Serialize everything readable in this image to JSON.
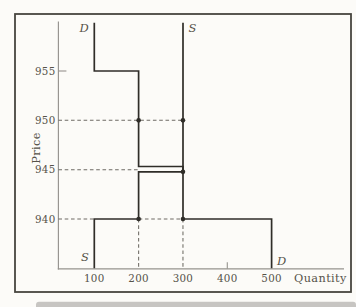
{
  "figure": {
    "colors": {
      "paper": "#fcfbf8",
      "frame": "#47453f",
      "axis": "#96938e",
      "curve": "#2f2d28",
      "dash": "#6e6b64",
      "text": "#565249",
      "band": "#c7c5c2"
    }
  },
  "chart_data": {
    "type": "line",
    "subtype": "step-supply-demand",
    "title": "",
    "xlabel": "Quantity",
    "ylabel": "Price",
    "x_ticks": [
      100,
      200,
      300,
      400,
      500
    ],
    "y_ticks": [
      940,
      945,
      950,
      955
    ],
    "xlim": [
      80,
      560
    ],
    "ylim": [
      935,
      960
    ],
    "grid": false,
    "visible_tick_marks": {
      "x": [
        400
      ],
      "y": [
        955
      ]
    },
    "series": [
      {
        "name": "D",
        "role": "demand",
        "points": [
          [
            100,
            959.9
          ],
          [
            100,
            955
          ],
          [
            200,
            955
          ],
          [
            200,
            945
          ],
          [
            300,
            945
          ],
          [
            300,
            940
          ],
          [
            500,
            940
          ],
          [
            500,
            935
          ]
        ]
      },
      {
        "name": "S",
        "role": "supply",
        "points": [
          [
            100,
            935
          ],
          [
            100,
            940
          ],
          [
            200,
            940
          ],
          [
            200,
            945
          ],
          [
            300,
            945
          ],
          [
            300,
            959.9
          ]
        ]
      }
    ],
    "markers": [
      {
        "q": 200,
        "p": 950
      },
      {
        "q": 300,
        "p": 950
      },
      {
        "q": 300,
        "p": 945,
        "on": "S"
      },
      {
        "q": 200,
        "p": 940
      },
      {
        "q": 300,
        "p": 940
      }
    ],
    "guides": [
      {
        "dir": "h",
        "p": 950,
        "q1": null,
        "q2": 300
      },
      {
        "dir": "h",
        "p": 945,
        "q1": null,
        "q2": 200
      },
      {
        "dir": "h",
        "p": 940,
        "q1": null,
        "q2": 100
      },
      {
        "dir": "h",
        "p": 940,
        "q1": 200,
        "q2": 300
      },
      {
        "dir": "v",
        "q": 200,
        "p1": 940,
        "p2": null
      },
      {
        "dir": "v",
        "q": 300,
        "p1": 940,
        "p2": null
      }
    ],
    "curve_labels": [
      {
        "text": "D",
        "q": 100,
        "p": 959.3,
        "side": "left"
      },
      {
        "text": "S",
        "q": 300,
        "p": 959.3,
        "side": "right"
      },
      {
        "text": "S",
        "q": 100,
        "p": 936.1,
        "side": "left"
      },
      {
        "text": "D",
        "q": 500,
        "p": 935.7,
        "side": "right"
      }
    ],
    "render_hints": {
      "separated_price": 945,
      "offsets_px": {
        "D": -3.2,
        "S": 2.2
      }
    }
  }
}
